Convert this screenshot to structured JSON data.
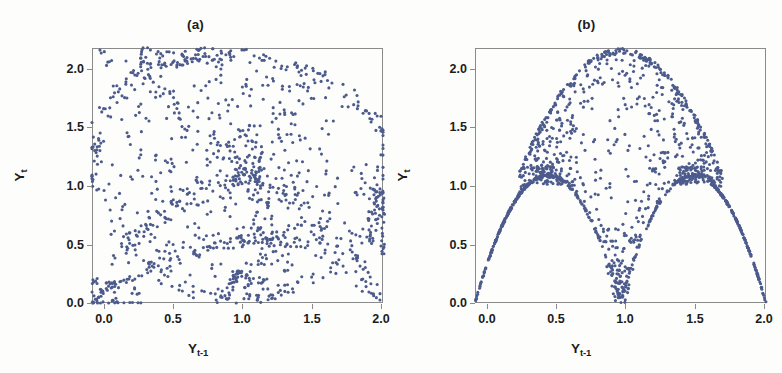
{
  "figure": {
    "background_color": "#fdfdfb",
    "point_color": "#4c5b8c",
    "axis_color": "#8a8a8a",
    "text_color": "#1c1c1c"
  },
  "panels": [
    {
      "id": "a",
      "title": "(a)",
      "xlabel_base": "Y",
      "xlabel_sub": "t-1",
      "ylabel_base": "Y",
      "ylabel_sub": "t",
      "xticks": [
        "0.0",
        "0.5",
        "1.0",
        "1.5",
        "2.0"
      ],
      "yticks": [
        "2.0",
        "1.5",
        "1.0",
        "0.5",
        "0.0"
      ]
    },
    {
      "id": "b",
      "title": "(b)",
      "xlabel_base": "Y",
      "xlabel_sub": "t-1",
      "ylabel_base": "Y",
      "ylabel_sub": "t",
      "xticks": [
        "0.0",
        "0.5",
        "1.0",
        "1.5",
        "2.0"
      ],
      "yticks": [
        "2.0",
        "1.5",
        "1.0",
        "0.5",
        "0.0"
      ]
    }
  ],
  "chart_data": [
    {
      "type": "scatter",
      "title": "(a)",
      "xlabel": "Y_{t-1}",
      "ylabel": "Y_t",
      "xlim": [
        0.0,
        2.0
      ],
      "ylim": [
        0.0,
        2.0
      ],
      "xticks": [
        0.0,
        0.5,
        1.0,
        1.5,
        2.0
      ],
      "yticks": [
        0.0,
        0.5,
        1.0,
        1.5,
        2.0
      ],
      "grid": false,
      "legend": "none",
      "marker_color": "#4c5b8c",
      "marker_size": 3,
      "n_points": 900,
      "description": "Noisy chaotic attractor: points fill a rounded blob spanning the full 0-2 square, densest along an arc from (0,0) up through (0.5,2.0) and down to (2.0,0.5), with internal filamentary strands crossing near (1.1,1.05).",
      "generator": "noisy-quadratic-attractor",
      "params": {
        "noise": 0.28,
        "a": 2.0,
        "seed": 7
      }
    },
    {
      "type": "scatter",
      "title": "(b)",
      "xlabel": "Y_{t-1}",
      "ylabel": "Y_t",
      "xlim": [
        0.0,
        2.0
      ],
      "ylim": [
        0.0,
        2.0
      ],
      "xticks": [
        0.0,
        0.5,
        1.0,
        1.5,
        2.0
      ],
      "yticks": [
        0.0,
        0.5,
        1.0,
        1.5,
        2.0
      ],
      "grid": false,
      "legend": "none",
      "marker_color": "#4c5b8c",
      "marker_size": 3,
      "n_points": 900,
      "description": "Double-hump map: sharp lower boundary formed by two tent-like arcs rising from (0.0,0.0) to (0.5,1.0) and from (1.0,0.0) up to (1.5,1.0) then back down to (2.0,0.0); the interior above is filled by a scattered cloud capped by a dome peaking at about (1.05,2.0).",
      "generator": "doubled-tent-map",
      "params": {
        "noise": 0.12,
        "a": 2.0,
        "seed": 11
      }
    }
  ]
}
